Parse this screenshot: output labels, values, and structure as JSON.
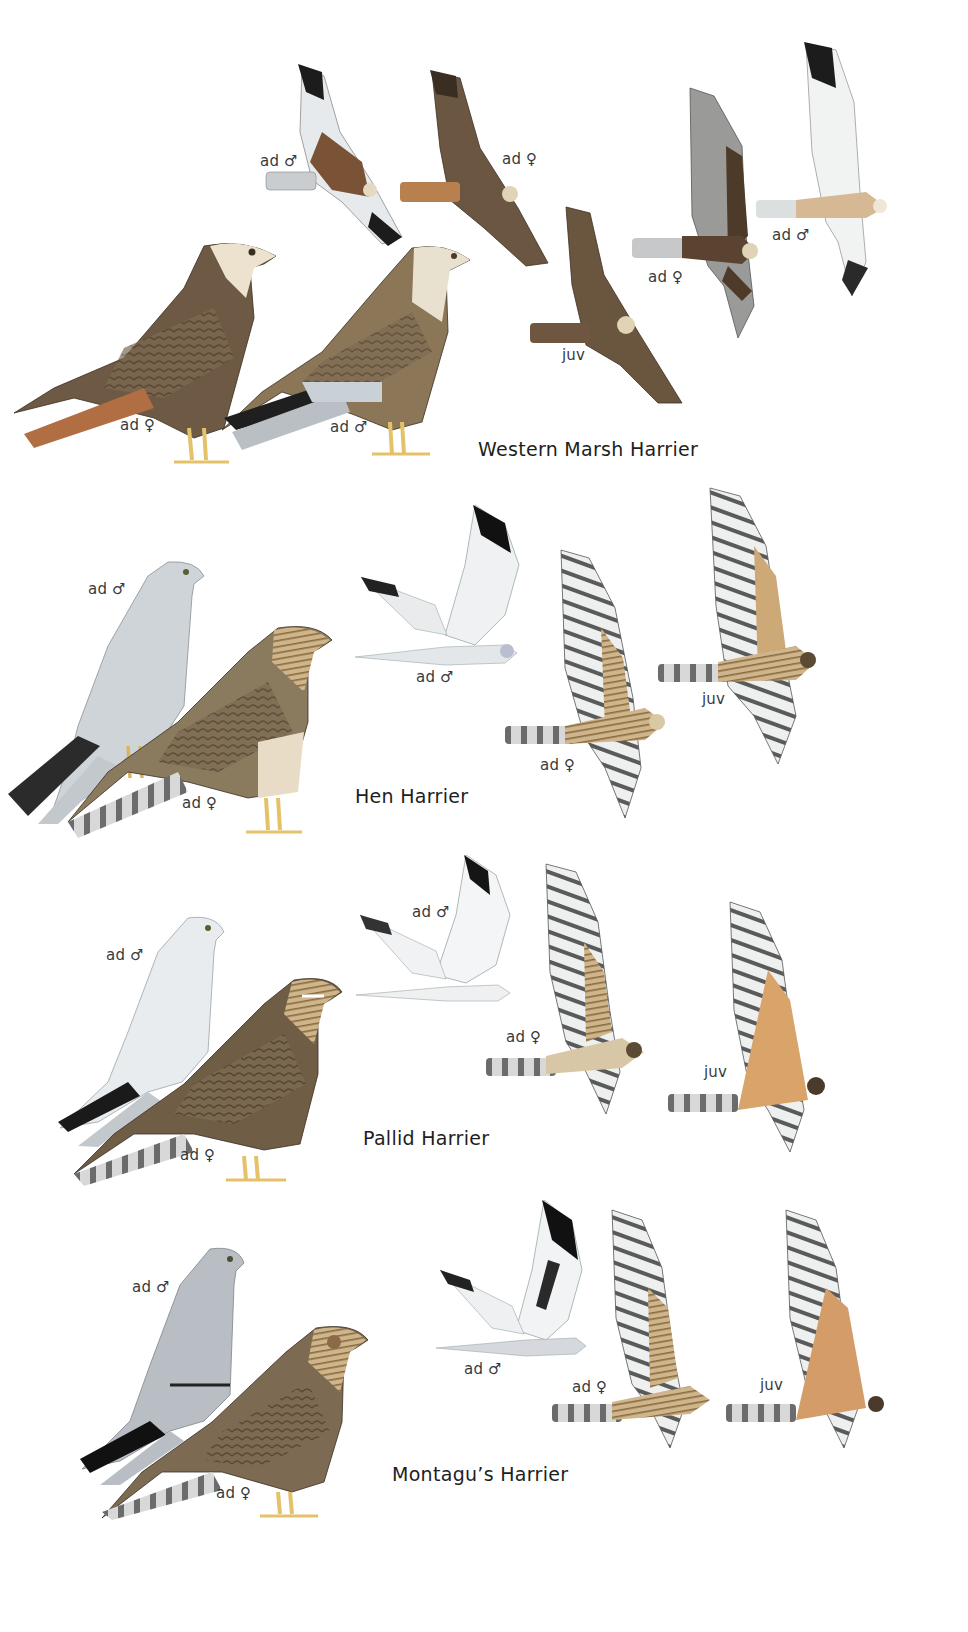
{
  "plate": {
    "sections": [
      {
        "title": "Western Marsh Harrier",
        "birds": [
          {
            "label": "ad ♂",
            "pose": "flight"
          },
          {
            "label": "ad ♀",
            "pose": "flight"
          },
          {
            "label": "juv",
            "pose": "flight"
          },
          {
            "label": "ad ♀",
            "pose": "flight"
          },
          {
            "label": "ad ♂",
            "pose": "flight"
          },
          {
            "label": "ad ♀",
            "pose": "perched"
          },
          {
            "label": "ad ♂",
            "pose": "perched"
          }
        ]
      },
      {
        "title": "Hen Harrier",
        "birds": [
          {
            "label": "ad ♂",
            "pose": "perched"
          },
          {
            "label": "ad ♀",
            "pose": "perched"
          },
          {
            "label": "ad ♂",
            "pose": "flight"
          },
          {
            "label": "ad ♀",
            "pose": "flight"
          },
          {
            "label": "juv",
            "pose": "flight"
          }
        ]
      },
      {
        "title": "Pallid Harrier",
        "birds": [
          {
            "label": "ad ♂",
            "pose": "perched"
          },
          {
            "label": "ad ♀",
            "pose": "perched"
          },
          {
            "label": "ad ♂",
            "pose": "flight"
          },
          {
            "label": "ad ♀",
            "pose": "flight"
          },
          {
            "label": "juv",
            "pose": "flight"
          }
        ]
      },
      {
        "title": "Montagu’s Harrier",
        "birds": [
          {
            "label": "ad ♂",
            "pose": "perched"
          },
          {
            "label": "ad ♀",
            "pose": "perched"
          },
          {
            "label": "ad ♂",
            "pose": "flight"
          },
          {
            "label": "ad ♀",
            "pose": "flight"
          },
          {
            "label": "juv",
            "pose": "flight"
          }
        ]
      }
    ],
    "colors": {
      "background": "#ffffff",
      "marsh_brown": "#6e5a44",
      "marsh_rufous_tail": "#b77a4e",
      "grey_male": "#cfd4d8",
      "pale_male": "#eceff1",
      "wingtip_black": "#1c1c1c",
      "female_brown": "#8a7658",
      "streaked_buff": "#c9ad83",
      "juv_orange": "#d8a46a",
      "legs_yellow": "#e8c86a",
      "text": "#333333"
    }
  }
}
